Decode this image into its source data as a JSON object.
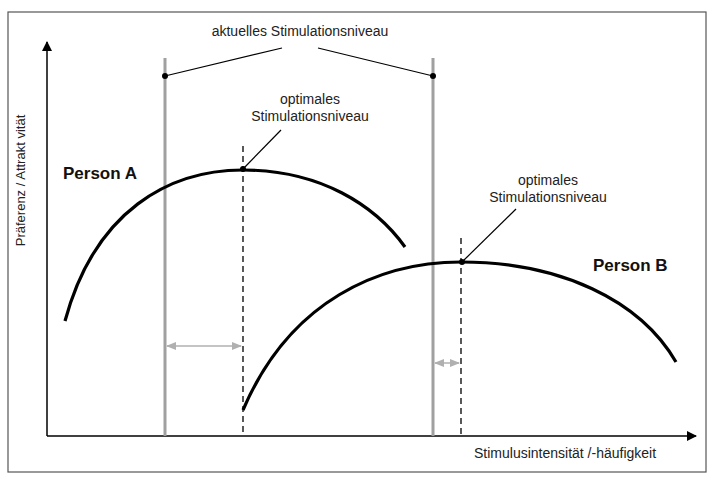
{
  "title": "aktuelles Stimulationsniveau",
  "labels": {
    "current_level": "aktuelles Stimulationsniveau",
    "optimal_a_line1": "optimales",
    "optimal_a_line2": "Stimulationsniveau",
    "optimal_b_line1": "optimales",
    "optimal_b_line2": "Stimulationsniveau",
    "person_a": "Person A",
    "person_b": "Person B",
    "y_axis": "Präferenz / Attrakt vität",
    "x_axis": "Stimulusintensität /-häufigkeit"
  },
  "colors": {
    "curve": "#000000",
    "current_level_line": "#a0a0a0",
    "optimal_line": "#000000",
    "distance_arrow": "#b0b0b0",
    "frame": "#555555"
  },
  "diagram": {
    "type": "inverted-U preference curves",
    "series": [
      {
        "name": "Person A",
        "current_level_x": 165,
        "optimal_level_x": 243
      },
      {
        "name": "Person B",
        "current_level_x": 433,
        "optimal_level_x": 461
      }
    ]
  }
}
